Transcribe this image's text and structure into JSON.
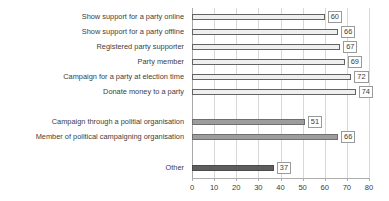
{
  "chart_data": {
    "type": "bar",
    "orientation": "horizontal",
    "title": "",
    "xlabel": "",
    "ylabel": "",
    "xlim": [
      0,
      80
    ],
    "xticks": [
      0,
      10,
      20,
      30,
      40,
      50,
      60,
      70,
      80
    ],
    "grid": true,
    "legend": "none",
    "categories": [
      "Show support for a party online",
      "Show support for a party offline",
      "Registered party supporter",
      "Party member",
      "Campaign for a party at election time",
      "Donate money to a party",
      "Campaign through a politial organisation",
      "Member of political campaigning organisation",
      "Other"
    ],
    "values": [
      60,
      66,
      67,
      69,
      72,
      74,
      51,
      66,
      37
    ],
    "groups": [
      {
        "name": "party-related activities",
        "color": "#efefef",
        "border": "#636363",
        "categories": [
          "Show support for a party online",
          "Show support for a party offline",
          "Registered party supporter",
          "Party member",
          "Campaign for a party at election time",
          "Donate money to a party"
        ],
        "values": [
          60,
          66,
          67,
          69,
          72,
          74
        ]
      },
      {
        "name": "campaigning organisation activities",
        "color": "#9d9d9d",
        "border": "#6e6e6e",
        "categories": [
          "Campaign through a politial organisation",
          "Member of political campaigning organisation"
        ],
        "values": [
          51,
          66
        ]
      },
      {
        "name": "other",
        "color": "#5e5e5e",
        "border": "#4a4a4a",
        "categories": [
          "Other"
        ],
        "values": [
          37
        ]
      }
    ],
    "bars": [
      {
        "label": "Show support for a party online",
        "value": 60,
        "value_text": "60",
        "group": 1,
        "row": 0
      },
      {
        "label": "Show support for a party offline",
        "value": 66,
        "value_text": "66",
        "group": 1,
        "row": 1
      },
      {
        "label": "Registered party supporter",
        "value": 67,
        "value_text": "67",
        "group": 1,
        "row": 2
      },
      {
        "label": "Party member",
        "value": 69,
        "value_text": "69",
        "group": 1,
        "row": 3
      },
      {
        "label": "Campaign for a party at election time",
        "value": 72,
        "value_text": "72",
        "group": 1,
        "row": 4
      },
      {
        "label": "Donate money to a party",
        "value": 74,
        "value_text": "74",
        "group": 1,
        "row": 5
      },
      {
        "label": "Campaign through a politial organisation",
        "value": 51,
        "value_text": "51",
        "group": 2,
        "row": 7
      },
      {
        "label": "Member of political campaigning organisation",
        "value": 66,
        "value_text": "66",
        "group": 2,
        "row": 8
      },
      {
        "label": "Other",
        "value": 37,
        "value_text": "37",
        "group": 3,
        "row": 10
      }
    ],
    "xticklabels": [
      "0",
      "10",
      "20",
      "30",
      "40",
      "50",
      "60",
      "70",
      "80"
    ]
  },
  "colors": {
    "group1_fill": "#efefef",
    "group2_fill": "#9d9d9d",
    "group3_fill": "#5e5e5e",
    "gridline": "#d7d7d7",
    "axis": "#aeaeae",
    "text": "#3a3a3a",
    "background": "#ffffff"
  }
}
